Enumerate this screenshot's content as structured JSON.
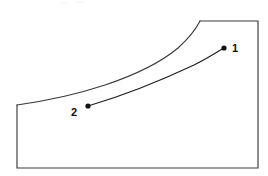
{
  "figure": {
    "background_color": "#ffffff",
    "width": 268,
    "height": 176,
    "line_color": "#3b3b3b",
    "process_line_color": "#1f1f1f",
    "marker_color": "#111111"
  },
  "labels": {
    "state_1": "1",
    "state_2": "2"
  },
  "chart_data": {
    "type": "line",
    "title": "",
    "xlabel": "",
    "ylabel": "",
    "grid": false,
    "legend": "none",
    "annotations": [
      {
        "text": "1",
        "x": 224,
        "y": 48,
        "label_x": 234,
        "label_y": 48
      },
      {
        "text": "2",
        "x": 88,
        "y": 106,
        "label_x": 76,
        "label_y": 112
      }
    ],
    "series": [
      {
        "name": "boundary-left-bottom-right",
        "type": "polyline",
        "points": [
          [
            17,
            105
          ],
          [
            17,
            168
          ],
          [
            258,
            168
          ],
          [
            258,
            21
          ],
          [
            200,
            21
          ]
        ]
      },
      {
        "name": "saturation-dome",
        "type": "curve",
        "points": [
          [
            17,
            105
          ],
          [
            50,
            100
          ],
          [
            90,
            90
          ],
          [
            125,
            78
          ],
          [
            155,
            66
          ],
          [
            178,
            48
          ],
          [
            192,
            33
          ],
          [
            200,
            21
          ]
        ]
      },
      {
        "name": "process-line-2-to-1",
        "type": "curve",
        "points": [
          [
            88,
            106
          ],
          [
            130,
            93
          ],
          [
            170,
            76
          ],
          [
            200,
            61
          ],
          [
            224,
            48
          ]
        ]
      }
    ]
  },
  "geometry": {
    "boundary_d": "M 17 105 L 17 168 L 258 168 L 258 21 L 200 21",
    "dome_d": "M 17 105 C 45 101 75 95 105 85 C 135 75 160 63 178 48 C 188 39 196 29 200 21",
    "process_d": "M 88 106 C 122 96 160 81 194 65 C 206 59 217 52 224 48",
    "dot_radius": 2.6,
    "state_1_dot": {
      "cx": 224,
      "cy": 48
    },
    "state_2_dot": {
      "cx": 88,
      "cy": 106
    },
    "state_1_label_pos": {
      "x": 232,
      "y": 52
    },
    "state_2_label_pos": {
      "x": 71,
      "y": 116
    }
  }
}
